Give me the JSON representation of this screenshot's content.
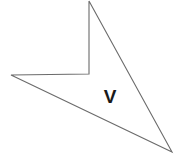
{
  "figure": {
    "type": "polygon",
    "shape_name": "concave-quadrilateral",
    "canvas": {
      "width": 175,
      "height": 156,
      "background": "#ffffff"
    },
    "stroke": {
      "color": "#6b6b6b",
      "width": 1.1
    },
    "fill": "#ffffff",
    "points_attr": "89,1 172,152 11,75 89,74",
    "vertices": [
      {
        "name": "top",
        "x": 89,
        "y": 1
      },
      {
        "name": "bottom-right",
        "x": 172,
        "y": 152
      },
      {
        "name": "left",
        "x": 11,
        "y": 75
      },
      {
        "name": "reflex-notch",
        "x": 89,
        "y": 74
      }
    ],
    "label": {
      "text": "V",
      "x": 110,
      "y": 103,
      "color": "#1a1a1a",
      "font_size": 19,
      "weight": "bold"
    }
  }
}
